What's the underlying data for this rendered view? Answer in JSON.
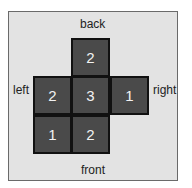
{
  "labels": {
    "back": "back",
    "left": "left",
    "right": "right",
    "front": "front"
  },
  "grid": {
    "rows": [
      [
        null,
        2,
        null
      ],
      [
        2,
        3,
        1
      ],
      [
        1,
        2,
        null
      ]
    ],
    "cell_color": "#4a4a4a",
    "background_color": "#e3e3e3"
  }
}
